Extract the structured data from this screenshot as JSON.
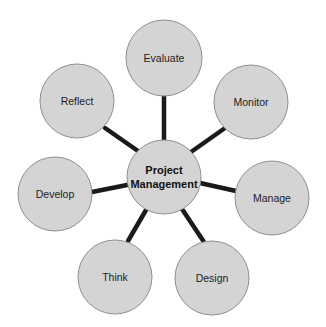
{
  "diagram": {
    "type": "hub-and-spoke",
    "background_color": "#ffffff",
    "node_fill": "#d4d4d4",
    "node_stroke": "#8f8f8f",
    "spoke_color": "#1a1a1a",
    "label_color": "#1c1c1c",
    "hub": {
      "label_line1": "Project",
      "label_line2": "Management",
      "cx": 164,
      "cy": 177,
      "r": 37
    },
    "nodes": [
      {
        "id": "evaluate",
        "label": "Evaluate",
        "cx": 164,
        "cy": 58,
        "r": 38
      },
      {
        "id": "monitor",
        "label": "Monitor",
        "cx": 251,
        "cy": 102,
        "r": 37
      },
      {
        "id": "manage",
        "label": "Manage",
        "cx": 272,
        "cy": 198,
        "r": 37
      },
      {
        "id": "design",
        "label": "Design",
        "cx": 212,
        "cy": 278,
        "r": 37
      },
      {
        "id": "think",
        "label": "Think",
        "cx": 115,
        "cy": 277,
        "r": 37
      },
      {
        "id": "develop",
        "label": "Develop",
        "cx": 55,
        "cy": 194,
        "r": 37
      },
      {
        "id": "reflect",
        "label": "Reflect",
        "cx": 77,
        "cy": 101,
        "r": 37
      }
    ],
    "spokes": [
      {
        "from": "hub",
        "to": "evaluate",
        "x1": 164,
        "y1": 140,
        "x2": 164,
        "y2": 96
      },
      {
        "from": "hub",
        "to": "monitor",
        "x1": 191,
        "y1": 152,
        "x2": 225,
        "y2": 128
      },
      {
        "from": "hub",
        "to": "manage",
        "x1": 200,
        "y1": 183,
        "x2": 236,
        "y2": 191
      },
      {
        "from": "hub",
        "to": "design",
        "x1": 182,
        "y1": 209,
        "x2": 204,
        "y2": 242
      },
      {
        "from": "hub",
        "to": "think",
        "x1": 146,
        "y1": 210,
        "x2": 128,
        "y2": 241
      },
      {
        "from": "hub",
        "to": "develop",
        "x1": 127,
        "y1": 185,
        "x2": 92,
        "y2": 192
      },
      {
        "from": "hub",
        "to": "reflect",
        "x1": 138,
        "y1": 151,
        "x2": 105,
        "y2": 128
      }
    ]
  }
}
